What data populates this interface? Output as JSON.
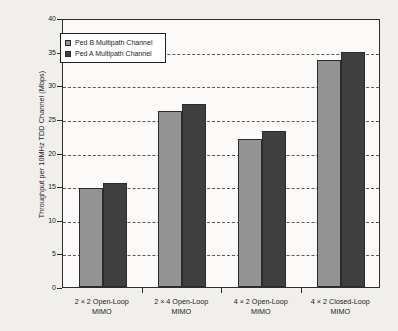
{
  "chart_data": {
    "type": "bar",
    "title": "",
    "xlabel": "",
    "ylabel": "Throughput per 10MHz TDD Channel (Mbps)",
    "ylim": [
      0,
      40
    ],
    "ytick_step": 5,
    "yticks": [
      0,
      5,
      10,
      15,
      20,
      25,
      30,
      35,
      40
    ],
    "ytick_labels": [
      "0",
      "5",
      "10",
      "15",
      "20",
      "25",
      "30",
      "35",
      "40"
    ],
    "grid": true,
    "grid_style": "dashed-horizontal",
    "legend_position": "upper-left-inside",
    "categories": [
      "2 × 2 Open-Loop\nMIMO",
      "2 × 4 Open-Loop\nMIMO",
      "4 × 2 Open-Loop\nMIMO",
      "4 × 2 Closed-Loop\nMIMO"
    ],
    "category_lines": [
      [
        "2 × 2 Open-Loop",
        "MIMO"
      ],
      [
        "2 × 4 Open-Loop",
        "MIMO"
      ],
      [
        "4 × 2 Open-Loop",
        "MIMO"
      ],
      [
        "4 × 2 Closed-Loop",
        "MIMO"
      ]
    ],
    "series": [
      {
        "name": "Ped B Multipath Channel",
        "color": "#939393",
        "values": [
          14.7,
          26.2,
          22.0,
          33.8
        ]
      },
      {
        "name": "Ped A Multipath Channel",
        "color": "#3f3f3f",
        "values": [
          15.5,
          27.2,
          23.2,
          35.0
        ]
      }
    ]
  },
  "legend": {
    "items": [
      {
        "label": "Ped B Multipath Channel"
      },
      {
        "label": "Ped A Multipath Channel"
      }
    ]
  },
  "colors": {
    "series_ped_b": "#939393",
    "series_ped_a": "#3f3f3f",
    "axis": "#2e2e2e",
    "grid": "#5a5a5a",
    "page_background": "#f1efec",
    "plot_background": "#fbfaf9"
  }
}
